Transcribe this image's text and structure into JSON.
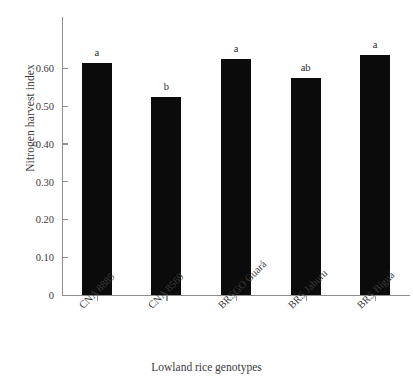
{
  "chart_data": {
    "type": "bar",
    "title": "",
    "subtitle": "",
    "xlabel": "Lowland rice genotypes",
    "ylabel": "Nitrogen harvest index",
    "categories": [
      "CNA 8885",
      "CNA 8569",
      "BRSGO Guará",
      "BRS Jaburu",
      "BRS Biguá"
    ],
    "values": [
      0.615,
      0.525,
      0.625,
      0.575,
      0.635
    ],
    "annotations": [
      "a",
      "b",
      "a",
      "ab",
      "a"
    ],
    "ylim": [
      0,
      0.68
    ],
    "yticks": [
      0,
      0.1,
      0.2,
      0.3,
      0.4,
      0.5,
      0.6
    ],
    "ytick_labels": [
      "0",
      "0.10",
      "0.20",
      "0.30",
      "0.40",
      "0.50",
      "0.60"
    ],
    "grid": false,
    "legend": false,
    "legend_position": "none",
    "bar_color": "#0b0b0b",
    "axis_color": "#8d8d8d",
    "text_color": "#3a3a3a",
    "background": "#ffffff"
  }
}
